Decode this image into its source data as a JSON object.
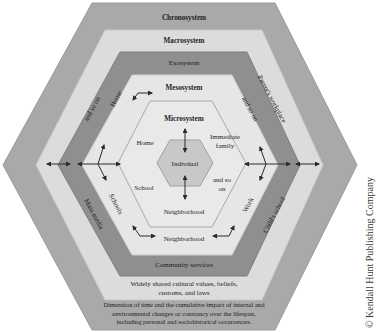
{
  "layers": {
    "chronosystem": {
      "title": "Chronosystem",
      "description_lines": [
        "Dimension of time and the cumulative impact of internal and",
        "environmental changes or constancy over the lifespan,",
        "including personal and sociohistorical occurrences."
      ],
      "color": "#a9a9a9"
    },
    "macrosystem": {
      "title": "Macrosystem",
      "description_lines": [
        "Widely shared cultural values, beliefs,",
        "customs, and laws"
      ],
      "color": "#dcdcdc"
    },
    "exosystem": {
      "title": "Exosystem",
      "items": {
        "left_top": "and so on",
        "right_top": "Parent's workplace",
        "left_bottom": "Mass media",
        "right_bottom": "Child's school",
        "bottom": "Community services"
      },
      "color": "#8f8f8f"
    },
    "mesosystem": {
      "title": "Mesosystem",
      "items": {
        "left_top": "Home",
        "right_top": "and so on",
        "left_bottom": "Schools",
        "right_bottom": "Work",
        "bottom": "Neighborhood"
      },
      "color": "#e6e6e6"
    },
    "microsystem": {
      "title": "Microsystem",
      "items": {
        "home": "Home",
        "immediate_family_line1": "Immediate",
        "immediate_family_line2": "family",
        "school": "School",
        "and_so_on_line1": "and so",
        "and_so_on_line2": "on",
        "neighborhood": "Neighborhood"
      },
      "color": "#e9e9e9"
    },
    "individual": {
      "title": "Indivdual",
      "color": "#c8c8c8"
    }
  },
  "copyright": "© Kendall Hunt Publishing Company"
}
